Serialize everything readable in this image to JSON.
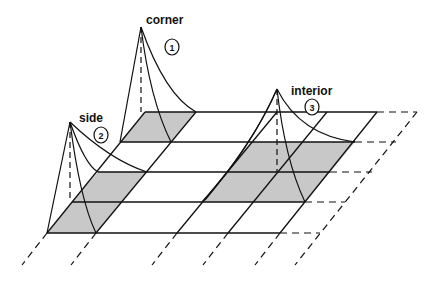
{
  "diagram": {
    "type": "finite-element grid with basis functions",
    "labels": [
      {
        "id": "corner",
        "text": "corner",
        "number": "1"
      },
      {
        "id": "side",
        "text": "side",
        "number": "2"
      },
      {
        "id": "interior",
        "text": "interior",
        "number": "3"
      }
    ],
    "colors": {
      "line": "#111111",
      "shade": "#c8c8c8",
      "background": "#ffffff"
    }
  }
}
